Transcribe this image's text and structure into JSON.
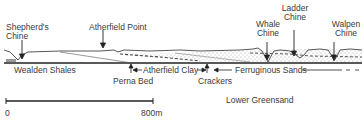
{
  "diagram": {
    "type": "geological cross-section",
    "top_labels": {
      "shepherds_chine": [
        "Shepherd's",
        "Chine"
      ],
      "atherfield_point": "Atherfield Point",
      "whale_chine": [
        "Whale",
        "Chine"
      ],
      "ladder_chine": [
        "Ladder",
        "Chine"
      ],
      "walpen_chine": [
        "Walpen",
        "Chine"
      ]
    },
    "strata_labels": {
      "wealden_shales": "Wealden Shales",
      "perna_bed": "Perna Bed",
      "atherfield_clay": "Atherfield Clay",
      "crackers": "Crackers",
      "ferruginous_sands": "Ferruginous Sands",
      "lower_greensand": "Lower Greensand"
    },
    "scale_bar": {
      "start_label": "0",
      "end_label": "800m"
    }
  }
}
